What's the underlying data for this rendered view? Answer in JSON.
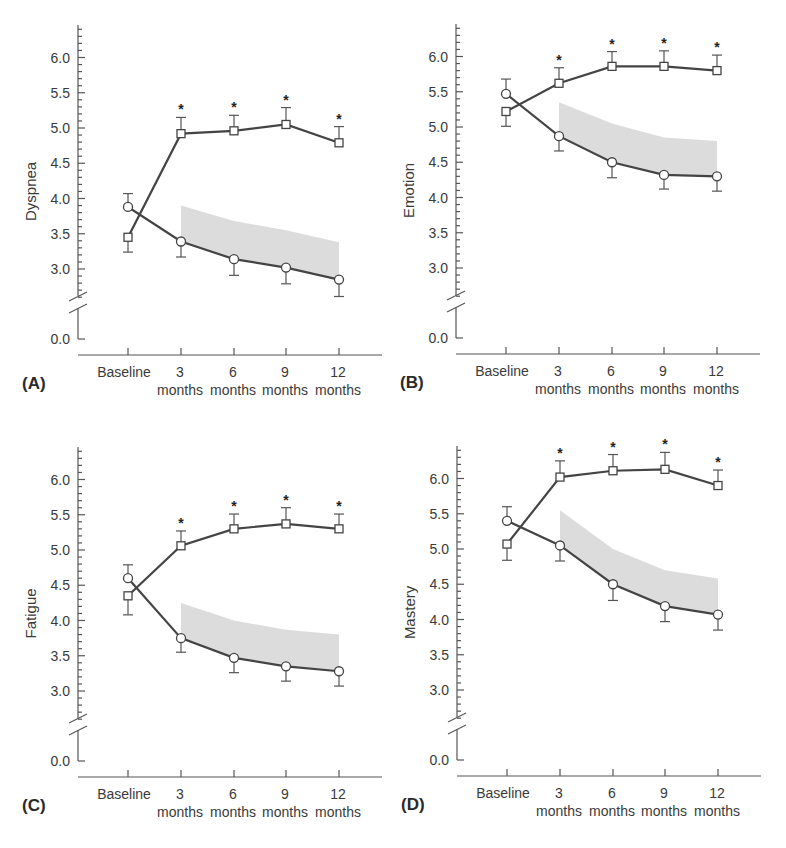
{
  "figure": {
    "x_categories": [
      {
        "top": "Baseline",
        "bottom": ""
      },
      {
        "top": "3",
        "bottom": "months"
      },
      {
        "top": "6",
        "bottom": "months"
      },
      {
        "top": "9",
        "bottom": "months"
      },
      {
        "top": "12",
        "bottom": "months"
      }
    ],
    "y_ticks": [
      "6.0",
      "5.5",
      "5.0",
      "4.5",
      "4.0",
      "3.5",
      "3.0",
      "0.0"
    ],
    "significance_marker": "*",
    "colors": {
      "line": "#444444",
      "band": "#dcdcdc",
      "axis": "#555555"
    }
  },
  "chart_data": [
    {
      "type": "line",
      "panel_label": "(A)",
      "ylabel": "Dyspnea",
      "xlabel": "",
      "categories": [
        "Baseline",
        "3 months",
        "6 months",
        "9 months",
        "12 months"
      ],
      "ylim": [
        0.0,
        6.45
      ],
      "axis_break": [
        0.0,
        2.6
      ],
      "y_ticks": [
        0.0,
        3.0,
        3.5,
        4.0,
        4.5,
        5.0,
        5.5,
        6.0
      ],
      "series": [
        {
          "name": "square",
          "marker": "square",
          "values": [
            3.45,
            4.92,
            4.96,
            5.05,
            4.79
          ],
          "error": [
            0.21,
            0.23,
            0.22,
            0.24,
            0.23
          ],
          "error_dir": [
            "down",
            "up",
            "up",
            "up",
            "up"
          ],
          "significant": [
            false,
            true,
            true,
            true,
            true
          ]
        },
        {
          "name": "circle",
          "marker": "circle",
          "values": [
            3.88,
            3.39,
            3.14,
            3.02,
            2.85
          ],
          "error": [
            0.19,
            0.22,
            0.23,
            0.23,
            0.24
          ],
          "error_dir": [
            "up",
            "down",
            "down",
            "down",
            "down"
          ],
          "significant": [
            false,
            false,
            false,
            false,
            false
          ]
        }
      ],
      "shaded_band": {
        "categories": [
          "3 months",
          "6 months",
          "9 months",
          "12 months"
        ],
        "upper": [
          3.9,
          3.68,
          3.55,
          3.38
        ],
        "lower": [
          3.39,
          3.14,
          3.02,
          2.85
        ]
      }
    },
    {
      "type": "line",
      "panel_label": "(B)",
      "ylabel": "Emotion",
      "xlabel": "",
      "categories": [
        "Baseline",
        "3 months",
        "6 months",
        "9 months",
        "12 months"
      ],
      "ylim": [
        0.0,
        6.45
      ],
      "axis_break": [
        0.0,
        2.6
      ],
      "y_ticks": [
        0.0,
        3.0,
        3.5,
        4.0,
        4.5,
        5.0,
        5.5,
        6.0
      ],
      "series": [
        {
          "name": "square",
          "marker": "square",
          "values": [
            5.22,
            5.62,
            5.86,
            5.86,
            5.8
          ],
          "error": [
            0.21,
            0.22,
            0.21,
            0.22,
            0.22
          ],
          "error_dir": [
            "down",
            "up",
            "up",
            "up",
            "up"
          ],
          "significant": [
            false,
            true,
            true,
            true,
            true
          ]
        },
        {
          "name": "circle",
          "marker": "circle",
          "values": [
            5.47,
            4.87,
            4.5,
            4.32,
            4.3
          ],
          "error": [
            0.21,
            0.21,
            0.22,
            0.2,
            0.21
          ],
          "error_dir": [
            "up",
            "down",
            "down",
            "down",
            "down"
          ],
          "significant": [
            false,
            false,
            false,
            false,
            false
          ]
        }
      ],
      "shaded_band": {
        "categories": [
          "3 months",
          "6 months",
          "9 months",
          "12 months"
        ],
        "upper": [
          5.35,
          5.05,
          4.85,
          4.8
        ],
        "lower": [
          4.87,
          4.5,
          4.32,
          4.3
        ]
      }
    },
    {
      "type": "line",
      "panel_label": "(C)",
      "ylabel": "Fatigue",
      "xlabel": "",
      "categories": [
        "Baseline",
        "3 months",
        "6 months",
        "9 months",
        "12 months"
      ],
      "ylim": [
        0.0,
        6.45
      ],
      "axis_break": [
        0.0,
        2.6
      ],
      "y_ticks": [
        0.0,
        3.0,
        3.5,
        4.0,
        4.5,
        5.0,
        5.5,
        6.0
      ],
      "series": [
        {
          "name": "square",
          "marker": "square",
          "values": [
            4.35,
            5.06,
            5.3,
            5.37,
            5.3
          ],
          "error": [
            0.27,
            0.21,
            0.21,
            0.23,
            0.21
          ],
          "error_dir": [
            "down",
            "up",
            "up",
            "up",
            "up"
          ],
          "significant": [
            false,
            true,
            true,
            true,
            true
          ]
        },
        {
          "name": "circle",
          "marker": "circle",
          "values": [
            4.6,
            3.75,
            3.47,
            3.35,
            3.28
          ],
          "error": [
            0.19,
            0.2,
            0.21,
            0.21,
            0.21
          ],
          "error_dir": [
            "up",
            "down",
            "down",
            "down",
            "down"
          ],
          "significant": [
            false,
            false,
            false,
            false,
            false
          ]
        }
      ],
      "shaded_band": {
        "categories": [
          "3 months",
          "6 months",
          "9 months",
          "12 months"
        ],
        "upper": [
          4.25,
          4.0,
          3.87,
          3.8
        ],
        "lower": [
          3.75,
          3.47,
          3.35,
          3.28
        ]
      }
    },
    {
      "type": "line",
      "panel_label": "(D)",
      "ylabel": "Mastery",
      "xlabel": "",
      "categories": [
        "Baseline",
        "3 months",
        "6 months",
        "9 months",
        "12 months"
      ],
      "ylim": [
        0.0,
        6.45
      ],
      "axis_break": [
        0.0,
        2.6
      ],
      "y_ticks": [
        0.0,
        3.0,
        3.5,
        4.0,
        4.5,
        5.0,
        5.5,
        6.0
      ],
      "series": [
        {
          "name": "square",
          "marker": "square",
          "values": [
            5.07,
            6.02,
            6.11,
            6.13,
            5.9
          ],
          "error": [
            0.23,
            0.23,
            0.23,
            0.24,
            0.22
          ],
          "error_dir": [
            "down",
            "up",
            "up",
            "up",
            "up"
          ],
          "significant": [
            false,
            true,
            true,
            true,
            true
          ]
        },
        {
          "name": "circle",
          "marker": "circle",
          "values": [
            5.4,
            5.05,
            4.5,
            4.19,
            4.07
          ],
          "error": [
            0.2,
            0.22,
            0.23,
            0.22,
            0.22
          ],
          "error_dir": [
            "up",
            "down",
            "down",
            "down",
            "down"
          ],
          "significant": [
            false,
            false,
            false,
            false,
            false
          ]
        }
      ],
      "shaded_band": {
        "categories": [
          "3 months",
          "6 months",
          "9 months",
          "12 months"
        ],
        "upper": [
          5.55,
          5.0,
          4.7,
          4.58
        ],
        "lower": [
          5.05,
          4.5,
          4.19,
          4.07
        ]
      }
    }
  ]
}
